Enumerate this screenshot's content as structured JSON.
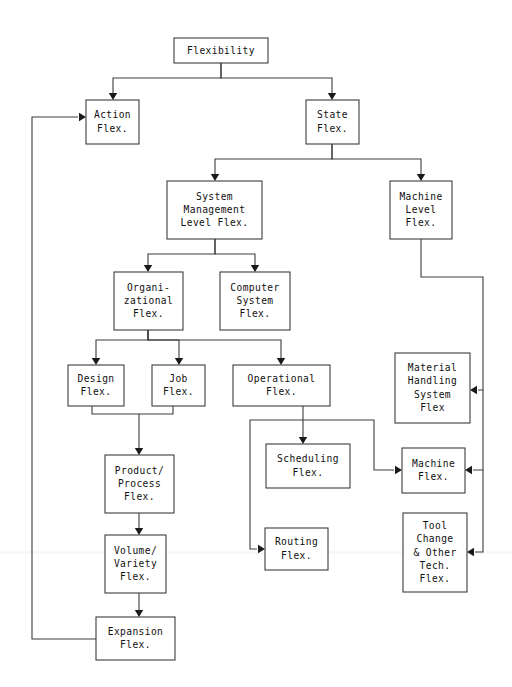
{
  "diagram": {
    "type": "tree-diagram",
    "background_color": "#ffffff",
    "box_stroke_color": "#3c3c3c",
    "text_color": "#101010",
    "nodes": [
      {
        "id": "flexibility",
        "lines": [
          "Flexibility"
        ],
        "x": 174,
        "y": 38,
        "w": 94,
        "h": 25
      },
      {
        "id": "action-flex",
        "lines": [
          "Action",
          "Flex."
        ],
        "x": 86,
        "y": 100,
        "w": 53,
        "h": 44
      },
      {
        "id": "state-flex",
        "lines": [
          "State",
          "Flex."
        ],
        "x": 306,
        "y": 100,
        "w": 53,
        "h": 44
      },
      {
        "id": "system-mgmt-flex",
        "lines": [
          "System",
          "Management",
          "Level Flex."
        ],
        "x": 167,
        "y": 181,
        "w": 95,
        "h": 58
      },
      {
        "id": "machine-level-flex",
        "lines": [
          "Machine",
          "Level",
          "Flex."
        ],
        "x": 390,
        "y": 181,
        "w": 62,
        "h": 58
      },
      {
        "id": "organizational-flex",
        "lines": [
          "Organi-",
          "zational",
          "Flex."
        ],
        "x": 114,
        "y": 272,
        "w": 69,
        "h": 58
      },
      {
        "id": "computer-sys-flex",
        "lines": [
          "Computer",
          "System",
          "Flex."
        ],
        "x": 220,
        "y": 272,
        "w": 70,
        "h": 58
      },
      {
        "id": "design-flex",
        "lines": [
          "Design",
          "Flex."
        ],
        "x": 68,
        "y": 365,
        "w": 56,
        "h": 41
      },
      {
        "id": "job-flex",
        "lines": [
          "Job",
          "Flex."
        ],
        "x": 152,
        "y": 365,
        "w": 53,
        "h": 41
      },
      {
        "id": "operational-flex",
        "lines": [
          "Operational",
          "Flex."
        ],
        "x": 233,
        "y": 365,
        "w": 97,
        "h": 41
      },
      {
        "id": "material-handling",
        "lines": [
          "Material",
          "Handling",
          "System",
          "Flex"
        ],
        "x": 395,
        "y": 353,
        "w": 75,
        "h": 70
      },
      {
        "id": "product-process",
        "lines": [
          "Product/",
          "Process",
          "Flex."
        ],
        "x": 105,
        "y": 455,
        "w": 69,
        "h": 58
      },
      {
        "id": "scheduling-flex",
        "lines": [
          "Scheduling",
          "Flex."
        ],
        "x": 266,
        "y": 444,
        "w": 84,
        "h": 44
      },
      {
        "id": "machine-flex",
        "lines": [
          "Machine",
          "Flex."
        ],
        "x": 402,
        "y": 448,
        "w": 63,
        "h": 45
      },
      {
        "id": "routing-flex",
        "lines": [
          "Routing",
          "Flex."
        ],
        "x": 265,
        "y": 528,
        "w": 63,
        "h": 42
      },
      {
        "id": "tool-change-flex",
        "lines": [
          "Tool",
          "Change",
          "& Other",
          "Tech.",
          "Flex."
        ],
        "x": 403,
        "y": 513,
        "w": 64,
        "h": 79
      },
      {
        "id": "volume-variety",
        "lines": [
          "Volume/",
          "Variety",
          "Flex."
        ],
        "x": 105,
        "y": 535,
        "w": 61,
        "h": 58
      },
      {
        "id": "expansion-flex",
        "lines": [
          "Expansion",
          "Flex."
        ],
        "x": 96,
        "y": 617,
        "w": 79,
        "h": 43
      }
    ],
    "edges": [
      {
        "id": "flexibility-to-action",
        "from": "flexibility",
        "to": "action-flex",
        "path": "M 221 63 L 221 78 L 113 78 L 113 94",
        "arrow": "down",
        "ax": 113,
        "ay": 100
      },
      {
        "id": "flexibility-to-state",
        "from": "flexibility",
        "to": "state-flex",
        "path": "M 221 63 L 221 78 L 332 78 L 332 94",
        "arrow": "down",
        "ax": 332,
        "ay": 100
      },
      {
        "id": "state-to-system-mgmt",
        "from": "state-flex",
        "to": "system-mgmt-flex",
        "path": "M 332 144 L 332 159 L 215 159 L 215 175",
        "arrow": "down",
        "ax": 215,
        "ay": 181
      },
      {
        "id": "state-to-machine-level",
        "from": "state-flex",
        "to": "machine-level-flex",
        "path": "M 332 144 L 332 159 L 421 159 L 421 175",
        "arrow": "down",
        "ax": 421,
        "ay": 181
      },
      {
        "id": "system-mgmt-to-organizational",
        "from": "system-mgmt-flex",
        "to": "organizational-flex",
        "path": "M 215 239 L 215 254 L 148 254 L 148 266",
        "arrow": "down",
        "ax": 148,
        "ay": 272
      },
      {
        "id": "system-mgmt-to-computer-sys",
        "from": "system-mgmt-flex",
        "to": "computer-sys-flex",
        "path": "M 215 239 L 215 254 L 255 254 L 255 266",
        "arrow": "down",
        "ax": 255,
        "ay": 272
      },
      {
        "id": "organizational-to-design",
        "from": "organizational-flex",
        "to": "design-flex",
        "path": "M 148 330 L 148 340 L 96 340 L 96 359",
        "arrow": "down",
        "ax": 96,
        "ay": 365
      },
      {
        "id": "organizational-to-job",
        "from": "organizational-flex",
        "to": "job-flex",
        "path": "M 148 330 L 148 340 L 179 340 L 179 359",
        "arrow": "down",
        "ax": 179,
        "ay": 365
      },
      {
        "id": "organizational-to-operational",
        "from": "organizational-flex",
        "to": "operational-flex",
        "path": "M 148 330 L 148 340 L 281 340 L 281 359",
        "arrow": "down",
        "ax": 281,
        "ay": 365
      },
      {
        "id": "design-job-to-product-process",
        "from": "design-flex",
        "to": "product-process",
        "path": "M 92 406 L 92 414 L 173 414 L 173 406 M 139 414 L 139 449",
        "arrow": "down",
        "ax": 139,
        "ay": 455
      },
      {
        "id": "product-to-volume",
        "from": "product-process",
        "to": "volume-variety",
        "path": "M 139 513 L 139 529",
        "arrow": "down",
        "ax": 139,
        "ay": 535
      },
      {
        "id": "volume-to-expansion",
        "from": "volume-variety",
        "to": "expansion-flex",
        "path": "M 139 593 L 139 611",
        "arrow": "down",
        "ax": 139,
        "ay": 617
      },
      {
        "id": "expansion-to-action",
        "from": "expansion-flex",
        "to": "action-flex",
        "path": "M 96 639 L 32 639 L 32 117 L 78 117",
        "arrow": "right",
        "ax": 86,
        "ay": 117
      },
      {
        "id": "operational-to-scheduling",
        "from": "operational-flex",
        "to": "scheduling-flex",
        "path": "M 303 406 L 303 438",
        "arrow": "down",
        "ax": 303,
        "ay": 444
      },
      {
        "id": "operational-to-routing",
        "from": "operational-flex",
        "to": "routing-flex",
        "path": "M 303 420 L 250 420 L 250 549 L 257 549",
        "arrow": "right",
        "ax": 265,
        "ay": 549
      },
      {
        "id": "operational-to-machine-flex",
        "from": "operational-flex",
        "to": "machine-flex",
        "path": "M 303 420 L 374 420 L 374 470 L 394 470",
        "arrow": "right",
        "ax": 402,
        "ay": 470
      },
      {
        "id": "machine-level-to-material",
        "from": "machine-level-flex",
        "to": "material-handling",
        "path": "M 421 239 L 421 277 L 483 277 L 483 390 L 478 390",
        "arrow": "left",
        "ax": 470,
        "ay": 390
      },
      {
        "id": "machine-level-to-machine-flex",
        "from": "machine-level-flex",
        "to": "machine-flex",
        "path": "M 483 390 L 483 470 L 473 470",
        "arrow": "left",
        "ax": 465,
        "ay": 470
      },
      {
        "id": "machine-level-to-tool-change",
        "from": "machine-level-flex",
        "to": "tool-change-flex",
        "path": "M 483 470 L 483 552 L 475 552",
        "arrow": "left",
        "ax": 467,
        "ay": 552
      }
    ]
  }
}
